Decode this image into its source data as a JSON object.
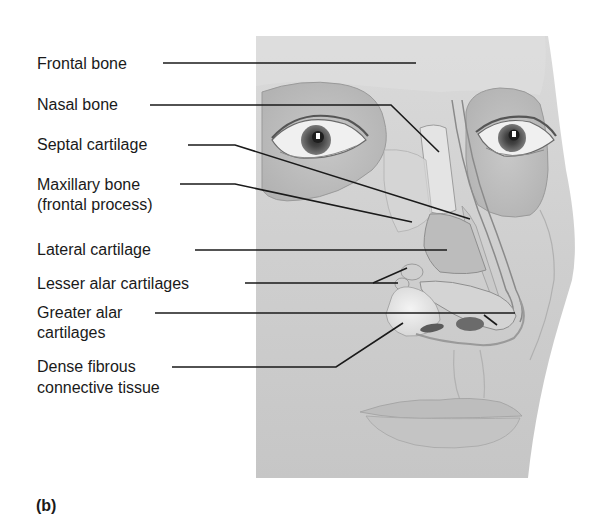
{
  "figure": {
    "panel_label": "(b)",
    "labels": [
      {
        "id": "frontal-bone",
        "lines": [
          "Frontal bone"
        ]
      },
      {
        "id": "nasal-bone",
        "lines": [
          "Nasal bone"
        ]
      },
      {
        "id": "septal-cartilage",
        "lines": [
          "Septal cartilage"
        ]
      },
      {
        "id": "maxillary-bone",
        "lines": [
          "Maxillary bone",
          "(frontal process)"
        ]
      },
      {
        "id": "lateral-cartilage",
        "lines": [
          "Lateral cartilage"
        ]
      },
      {
        "id": "lesser-alar-cartilages",
        "lines": [
          "Lesser alar cartilages"
        ]
      },
      {
        "id": "greater-alar-cartilages",
        "lines": [
          "Greater alar",
          "cartilages"
        ]
      },
      {
        "id": "dense-fibrous-connective-tissue",
        "lines": [
          "Dense fibrous",
          "connective tissue"
        ]
      }
    ]
  },
  "colors": {
    "background": "#ffffff",
    "skin": "#c9c9c9",
    "skin_light": "#dedede",
    "skin_dark": "#a8a8a8",
    "bone": "#e2e2e2",
    "cartilage": "#bdbdbd",
    "leader_line": "#1a1a1a",
    "text": "#1a1a1a"
  }
}
